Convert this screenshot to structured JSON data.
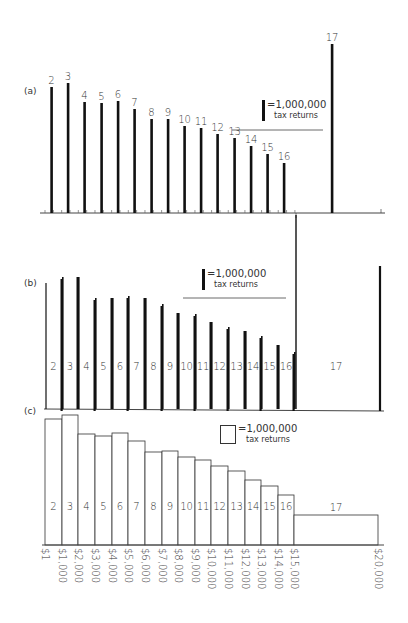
{
  "chart_data": [
    {
      "panel": "(a)",
      "type": "bar",
      "style": "spike",
      "title": "",
      "categories": [
        "2",
        "3",
        "4",
        "5",
        "6",
        "7",
        "8",
        "9",
        "10",
        "11",
        "12",
        "13",
        "14",
        "15",
        "16",
        "17"
      ],
      "values": [
        126,
        130,
        111,
        110,
        112,
        104,
        94,
        94,
        87,
        85,
        79,
        75,
        67,
        59,
        50,
        169
      ],
      "legend": {
        "symbol": "bar",
        "line1": "=1,000,000",
        "line2": "tax returns"
      },
      "xlabel": "",
      "ylabel": "",
      "grid": false
    },
    {
      "panel": "(b)",
      "type": "bar",
      "style": "spike-pairs",
      "categories": [
        "2",
        "3",
        "4",
        "5",
        "6",
        "7",
        "8",
        "9",
        "10",
        "11",
        "12",
        "13",
        "14",
        "15",
        "16",
        "17"
      ],
      "values": [
        126,
        130,
        111,
        110,
        112,
        104,
        94,
        94,
        87,
        85,
        79,
        75,
        67,
        59,
        50,
        169
      ],
      "legend": {
        "symbol": "bar",
        "line1": "=1,000,000",
        "line2": "tax returns"
      },
      "grid": false
    },
    {
      "panel": "(c)",
      "type": "bar",
      "style": "histogram",
      "categories": [
        "2",
        "3",
        "4",
        "5",
        "6",
        "7",
        "8",
        "9",
        "10",
        "11",
        "12",
        "13",
        "14",
        "15",
        "16",
        "17"
      ],
      "values": [
        126,
        130,
        111,
        109,
        112,
        104,
        93,
        94,
        88,
        85,
        79,
        74,
        65,
        59,
        50,
        30
      ],
      "bin_edges_labels": [
        "$1",
        "$1,000",
        "$2,000",
        "$3,000",
        "$4,000",
        "$5,000",
        "$6,000",
        "$7,000",
        "$8,000",
        "$9,000",
        "$10,000",
        "$11,000",
        "$12,000",
        "$13,000",
        "$14,000",
        "$15,000",
        "$20,000"
      ],
      "legend": {
        "symbol": "box",
        "line1": "=1,000,000",
        "line2": "tax returns"
      },
      "grid": false
    }
  ],
  "panels": {
    "a": {
      "label": "(a)"
    },
    "b": {
      "label": "(b)"
    },
    "c": {
      "label": "(c)"
    }
  },
  "legend": {
    "line1": "=1,000,000",
    "line2": "tax returns"
  },
  "bar_labels": [
    "2",
    "3",
    "4",
    "5",
    "6",
    "7",
    "8",
    "9",
    "10",
    "11",
    "12",
    "13",
    "14",
    "15",
    "16",
    "17"
  ],
  "x_axis_labels": [
    "$1",
    "$1,000",
    "$2,000",
    "$3,000",
    "$4,000",
    "$5,000",
    "$6,000",
    "$7,000",
    "$8,000",
    "$9,000",
    "$10,000",
    "$11,000",
    "$12,000",
    "$13,000",
    "$14,000",
    "$15,000",
    "$20,000"
  ],
  "colors": {
    "ink": "#111111",
    "text": "#333333",
    "background": "#ffffff"
  }
}
